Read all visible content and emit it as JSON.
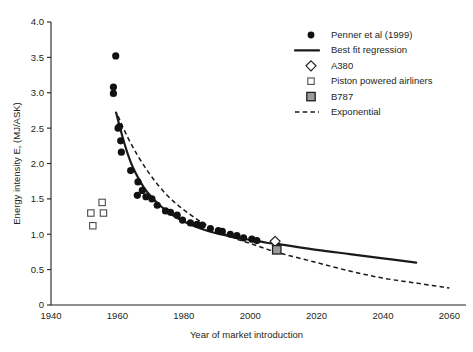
{
  "chart_data": {
    "type": "scatter",
    "title": "",
    "xlabel": "Year of market introduction",
    "ylabel": "Energy intensity E, (MJ/ASK)",
    "xlim": [
      1940,
      2065
    ],
    "ylim": [
      0,
      4.0
    ],
    "xticks": [
      1940,
      1960,
      1980,
      2000,
      2020,
      2040,
      2060
    ],
    "yticks": [
      "0",
      "0.5",
      "1.0",
      "1.5",
      "2.0",
      "2.5",
      "3.0",
      "3.5",
      "4.0"
    ],
    "ytick_values": [
      0,
      0.5,
      1.0,
      1.5,
      2.0,
      2.5,
      3.0,
      3.5,
      4.0
    ],
    "grid": false,
    "legend_position": "top-right",
    "series": [
      {
        "name": "Penner et al (1999)",
        "marker": "filled-circle",
        "color": "#111111",
        "points": [
          [
            1959.5,
            3.52
          ],
          [
            1958.8,
            3.08
          ],
          [
            1958.8,
            2.99
          ],
          [
            1960.6,
            2.52
          ],
          [
            1960.2,
            2.5
          ],
          [
            1961.0,
            2.32
          ],
          [
            1961.2,
            2.16
          ],
          [
            1964.0,
            1.9
          ],
          [
            1966.2,
            1.74
          ],
          [
            1967.5,
            1.62
          ],
          [
            1966.0,
            1.55
          ],
          [
            1968.6,
            1.53
          ],
          [
            1970.4,
            1.5
          ],
          [
            1972.0,
            1.41
          ],
          [
            1974.5,
            1.33
          ],
          [
            1976.0,
            1.31
          ],
          [
            1978.0,
            1.27
          ],
          [
            1979.6,
            1.2
          ],
          [
            1982.0,
            1.16
          ],
          [
            1984.0,
            1.14
          ],
          [
            1985.6,
            1.13
          ],
          [
            1988.0,
            1.08
          ],
          [
            1990.4,
            1.05
          ],
          [
            1991.6,
            1.04
          ],
          [
            1994.0,
            1.0
          ],
          [
            1996.0,
            0.98
          ],
          [
            1998.0,
            0.95
          ],
          [
            2000.5,
            0.93
          ],
          [
            2002.0,
            0.91
          ]
        ]
      },
      {
        "name": "Piston powered airliners",
        "marker": "open-square",
        "color": "#4d4d4d",
        "points": [
          [
            1952.0,
            1.3
          ],
          [
            1952.6,
            1.12
          ],
          [
            1955.4,
            1.45
          ],
          [
            1955.8,
            1.3
          ]
        ]
      },
      {
        "name": "A380",
        "marker": "open-diamond",
        "color": "#231f20",
        "points": [
          [
            2007.5,
            0.9
          ]
        ]
      },
      {
        "name": "B787",
        "marker": "gray-square",
        "color": "#9b9b9b",
        "points": [
          [
            2008.0,
            0.78
          ]
        ]
      }
    ],
    "curves": [
      {
        "name": "Best fit regression",
        "style": "solid",
        "color": "#1a1a1a",
        "points": [
          [
            1959.6,
            2.72
          ],
          [
            1962.0,
            2.3
          ],
          [
            1964.0,
            2.02
          ],
          [
            1966.0,
            1.82
          ],
          [
            1968.0,
            1.66
          ],
          [
            1970.0,
            1.54
          ],
          [
            1973.0,
            1.4
          ],
          [
            1976.0,
            1.29
          ],
          [
            1980.0,
            1.18
          ],
          [
            1985.0,
            1.08
          ],
          [
            1990.0,
            1.01
          ],
          [
            1995.0,
            0.96
          ],
          [
            2000.0,
            0.92
          ],
          [
            2005.0,
            0.88
          ],
          [
            2010.0,
            0.85
          ],
          [
            2020.0,
            0.78
          ],
          [
            2030.0,
            0.72
          ],
          [
            2040.0,
            0.66
          ],
          [
            2050.0,
            0.6
          ]
        ]
      },
      {
        "name": "Exponential",
        "style": "dashed",
        "color": "#1a1a1a",
        "points": [
          [
            1960.2,
            2.67
          ],
          [
            1963.0,
            2.38
          ],
          [
            1966.0,
            2.12
          ],
          [
            1969.0,
            1.9
          ],
          [
            1972.0,
            1.71
          ],
          [
            1975.0,
            1.55
          ],
          [
            1978.0,
            1.42
          ],
          [
            1981.0,
            1.31
          ],
          [
            1985.0,
            1.18
          ],
          [
            1990.0,
            1.05
          ],
          [
            1995.0,
            0.95
          ],
          [
            2000.0,
            0.87
          ],
          [
            2005.0,
            0.79
          ],
          [
            2010.0,
            0.72
          ],
          [
            2020.0,
            0.6
          ],
          [
            2030.0,
            0.48
          ],
          [
            2040.0,
            0.38
          ],
          [
            2050.0,
            0.31
          ],
          [
            2060.0,
            0.24
          ]
        ]
      }
    ],
    "legend": [
      {
        "label": "Penner et al (1999)",
        "marker": "filled-circle"
      },
      {
        "label": "Best fit regression",
        "marker": "solid-line"
      },
      {
        "label": "A380",
        "marker": "open-diamond"
      },
      {
        "label": "Piston powered airliners",
        "marker": "open-square"
      },
      {
        "label": "B787",
        "marker": "gray-square"
      },
      {
        "label": "Exponential",
        "marker": "dashed-line"
      }
    ]
  }
}
